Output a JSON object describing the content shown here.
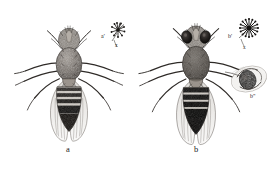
{
  "plate": {
    "kind": "scientific-illustration",
    "subject": "Drosophila flies, dorsal view, comparative plate",
    "technique": "engraving / stipple halftone",
    "background_color": "#ffffff",
    "ink_color": "#1b1b1b",
    "width": 277,
    "height": 169
  },
  "figures": [
    {
      "id": "a",
      "caption": "a",
      "caption_x": 68,
      "caption_y": 150,
      "description": "Wild-type fly, dorsal view, wings spread, pale banded abdomen",
      "center_x": 69,
      "center_y": 76
    },
    {
      "id": "b",
      "caption": "b",
      "caption_x": 196,
      "caption_y": 150,
      "description": "Mutant fly, dorsal view, dark heavily banded abdomen, enlarged eyes",
      "center_x": 196,
      "center_y": 76
    }
  ],
  "callouts": [
    {
      "id": "a-prime",
      "label": "a'",
      "label_x": 103,
      "label_y": 36,
      "marker": "x",
      "marker_x": 117,
      "marker_y": 45,
      "detail": "bristle rosette detail of figure a",
      "glyph_x": 118,
      "glyph_y": 30
    },
    {
      "id": "b-prime",
      "label": "b'",
      "label_x": 230,
      "label_y": 36,
      "marker": "x",
      "marker_x": 245,
      "marker_y": 47,
      "detail": "bristle rosette detail of figure b, radiating",
      "glyph_x": 248,
      "glyph_y": 28
    },
    {
      "id": "b-double-prime",
      "label": "b\"",
      "label_x": 252,
      "label_y": 96,
      "detail": "oval inset, eye / ocellus detail of figure b",
      "glyph_x": 249,
      "glyph_y": 79
    }
  ]
}
